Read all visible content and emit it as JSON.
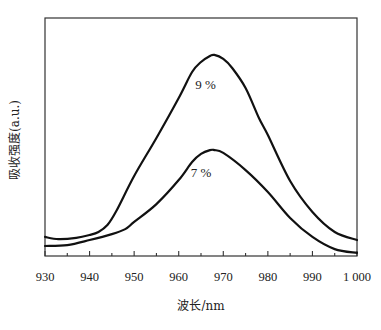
{
  "chart_data": {
    "type": "line",
    "title": "",
    "xlabel": "波长/nm",
    "ylabel": "吸收强度(a.u.)",
    "xlim": [
      930,
      1000
    ],
    "ylim": [
      0,
      1
    ],
    "x_ticks": [
      930,
      940,
      950,
      960,
      970,
      980,
      990,
      1000
    ],
    "x_tick_labels": [
      "930",
      "940",
      "950",
      "960",
      "970",
      "980",
      "990",
      "1 000"
    ],
    "x_minor_ticks": [
      935,
      945,
      955,
      965,
      975,
      985,
      995
    ],
    "y_ticks": [],
    "grid": false,
    "legend": "none (inline curve labels)",
    "series": [
      {
        "name": "9 %",
        "label_position": {
          "x": 966,
          "y": 0.7
        },
        "x": [
          930,
          933,
          937,
          940,
          942,
          944,
          946,
          950,
          955,
          960,
          963,
          965,
          967,
          968,
          970,
          972,
          975,
          978,
          980,
          985,
          990,
          995,
          1000
        ],
        "values": [
          0.08,
          0.071,
          0.076,
          0.088,
          0.101,
          0.13,
          0.189,
          0.336,
          0.496,
          0.664,
          0.773,
          0.815,
          0.84,
          0.845,
          0.828,
          0.79,
          0.706,
          0.58,
          0.508,
          0.315,
          0.185,
          0.101,
          0.067
        ]
      },
      {
        "name": "7 %",
        "label_position": {
          "x": 965,
          "y": 0.33
        },
        "x": [
          930,
          935,
          940,
          945,
          948,
          950,
          955,
          960,
          963,
          965,
          967,
          968,
          970,
          975,
          980,
          985,
          990,
          995,
          1000
        ],
        "values": [
          0.042,
          0.046,
          0.067,
          0.092,
          0.113,
          0.143,
          0.218,
          0.319,
          0.395,
          0.429,
          0.445,
          0.445,
          0.433,
          0.361,
          0.269,
          0.16,
          0.08,
          0.029,
          0.013
        ]
      }
    ],
    "colors": {
      "line": "#111111",
      "frame": "#333333",
      "background": "#ffffff"
    }
  }
}
